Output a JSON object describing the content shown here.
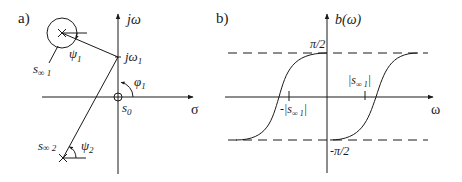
{
  "panel_a": {
    "label": "a)",
    "axis_imag_label": "jω",
    "axis_real_label": "σ",
    "point_jw1_label": "jω",
    "point_jw1_sub": "1",
    "origin_label": "s",
    "origin_sub": "0",
    "angle_phi_label": "φ",
    "angle_phi_sub": "1",
    "pole1_label": "s",
    "pole1_sub": "∞ 1",
    "angle_psi1_label": "ψ",
    "angle_psi1_sub": "1",
    "pole2_label": "s",
    "pole2_sub": "∞ 2",
    "angle_psi2_label": "ψ",
    "angle_psi2_sub": "2"
  },
  "panel_b": {
    "label": "b)",
    "y_axis_label": "b(ω)",
    "x_axis_label": "ω",
    "upper_level_label": "π/2",
    "lower_level_label": "-π/2",
    "tick_pos_label": "|s",
    "tick_pos_sub": "∞ 1",
    "tick_pos_close": "|",
    "tick_neg_label": "-|s",
    "tick_neg_sub": "∞ 1",
    "tick_neg_close": "|"
  }
}
